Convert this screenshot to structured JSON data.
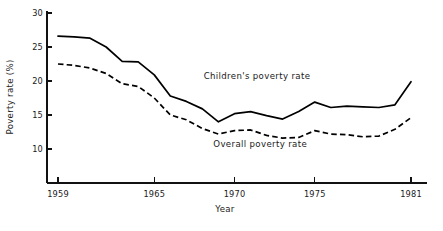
{
  "chart_data": {
    "type": "line",
    "title": "",
    "xlabel": "Year",
    "ylabel": "Poverty rate (%)",
    "xlim": [
      1959,
      1981
    ],
    "ylim": [
      10,
      30
    ],
    "grid": false,
    "legend_position": "inline-annotation",
    "x": [
      1959,
      1960,
      1961,
      1962,
      1963,
      1964,
      1965,
      1966,
      1967,
      1968,
      1969,
      1970,
      1971,
      1972,
      1973,
      1974,
      1975,
      1976,
      1977,
      1978,
      1979,
      1980,
      1981
    ],
    "xticks": [
      1959,
      1965,
      1970,
      1975,
      1981
    ],
    "xticklabels": [
      "1959",
      "1965",
      "1970",
      "1975",
      "1981"
    ],
    "yticks": [
      10,
      15,
      20,
      25,
      30
    ],
    "yticklabels": [
      "10",
      "15",
      "20",
      "25",
      "30"
    ],
    "series": [
      {
        "name": "Children's poverty rate",
        "style": "solid",
        "annotation": "Children's poverty rate",
        "values": [
          26.6,
          26.5,
          26.3,
          25.0,
          22.9,
          22.8,
          20.9,
          17.8,
          17.0,
          15.9,
          14.0,
          15.2,
          15.5,
          14.9,
          14.4,
          15.5,
          16.9,
          16.1,
          16.3,
          16.2,
          16.1,
          16.5,
          19.9
        ]
      },
      {
        "name": "Overall poverty rate",
        "style": "dashed",
        "annotation": "Overall poverty rate",
        "values": [
          22.5,
          22.3,
          21.9,
          21.1,
          19.6,
          19.2,
          17.5,
          15.0,
          14.3,
          13.0,
          12.2,
          12.7,
          12.8,
          12.0,
          11.6,
          11.7,
          12.7,
          12.2,
          12.1,
          11.8,
          11.9,
          12.9,
          14.6
        ]
      }
    ],
    "annotations": [
      {
        "text": "Children's poverty rate",
        "x": 1971.4,
        "y": 20.3
      },
      {
        "text": "Overall poverty rate",
        "x": 1971.6,
        "y": 10.3
      }
    ]
  }
}
